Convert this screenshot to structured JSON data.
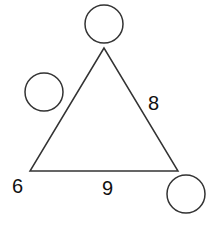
{
  "diagram": {
    "stroke_color": "#333333",
    "triangle": {
      "vertices": {
        "top": {
          "x": 104,
          "y": 48
        },
        "bottom_left": {
          "x": 30,
          "y": 171
        },
        "bottom_right": {
          "x": 178,
          "y": 171
        }
      }
    },
    "labels": {
      "bottom_left_vertex": "6",
      "bottom_edge": "9",
      "right_edge": "8"
    },
    "circles": [
      {
        "name": "top-vertex-circle",
        "cx": 104,
        "cy": 24,
        "r": 19,
        "value": ""
      },
      {
        "name": "left-edge-circle",
        "cx": 44,
        "cy": 92,
        "r": 19,
        "value": ""
      },
      {
        "name": "bottom-right-vertex-circle",
        "cx": 186,
        "cy": 194,
        "r": 19,
        "value": ""
      }
    ]
  }
}
